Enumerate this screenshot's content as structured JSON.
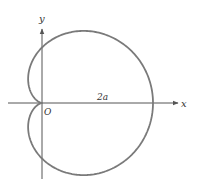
{
  "figure": {
    "title": "",
    "type": "cardioid",
    "equation": "r = a(1 + cos θ)",
    "labels": {
      "x_axis": "x",
      "y_axis": "y",
      "origin": "O",
      "distance": "2a"
    },
    "colors": {
      "curve": "#7a7a7a",
      "axes": "#555555",
      "text": "#333333",
      "background": "#ffffff"
    },
    "geometry": {
      "origin_px": [
        42,
        103
      ],
      "a_px": 55.5
    }
  }
}
